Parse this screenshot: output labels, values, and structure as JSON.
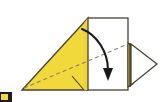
{
  "figure": {
    "kind": "origami-fold-diagram",
    "background_color": "#ffffff",
    "width": 161,
    "height": 102
  },
  "palette": {
    "paper_front": "#f2d93b",
    "paper_front_shade": "#efd233",
    "paper_back": "#ffffff",
    "outline": "#4a4234",
    "outline_dark": "#3a3428",
    "fold_dash": "#8a8272",
    "arrow": "#1a1a1a",
    "marker": "#1c1c1c"
  },
  "shapes": {
    "large_triangle": {
      "name": "large-yellow-triangle",
      "fill": "#f2d93b",
      "points": "22,90 88,18 88,90"
    },
    "white_rectangle": {
      "name": "white-rectangle-panel",
      "fill": "#ffffff",
      "x": 88,
      "y": 18,
      "width": 40,
      "height": 72
    },
    "yellow_sliver": {
      "name": "yellow-edge-sliver",
      "fill": "#efd233",
      "points": "128,44 133,48 133,84 128,86"
    },
    "right_triangle_flap": {
      "name": "right-white-triangle-flap",
      "fill": "#ffffff",
      "points": "130,44 157,64 130,85"
    }
  },
  "fold_lines": [
    {
      "name": "main-diagonal-fold",
      "style": "dashed",
      "from": [
        24,
        88
      ],
      "to": [
        128,
        44
      ]
    }
  ],
  "arrow": {
    "name": "fold-direction-arrow",
    "style": "curved-solid",
    "start": [
      82,
      29
    ],
    "end": [
      108,
      78
    ],
    "head": "filled-triangle-down"
  },
  "corner_marker": {
    "name": "corner-thumbnail-marker",
    "color": "#1c1c1c",
    "accent": "#f2d93b"
  }
}
